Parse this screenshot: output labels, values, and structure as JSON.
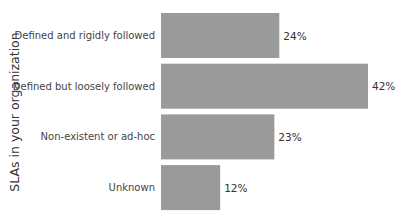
{
  "chart_data": {
    "type": "bar",
    "orientation": "horizontal",
    "title": "",
    "xlabel": "",
    "ylabel": "SLAs in your organization",
    "categories": [
      "Defined and rigidly followed",
      "Defined but loosely followed",
      "Non-existent or ad-hoc",
      "Unknown"
    ],
    "values": [
      24,
      42,
      23,
      12
    ],
    "value_labels": [
      "24%",
      "42%",
      "23%",
      "12%"
    ],
    "unit": "%",
    "xlim": [
      0,
      42
    ],
    "grid": false,
    "legend": "none",
    "bar_color": "#9a9a9a"
  }
}
